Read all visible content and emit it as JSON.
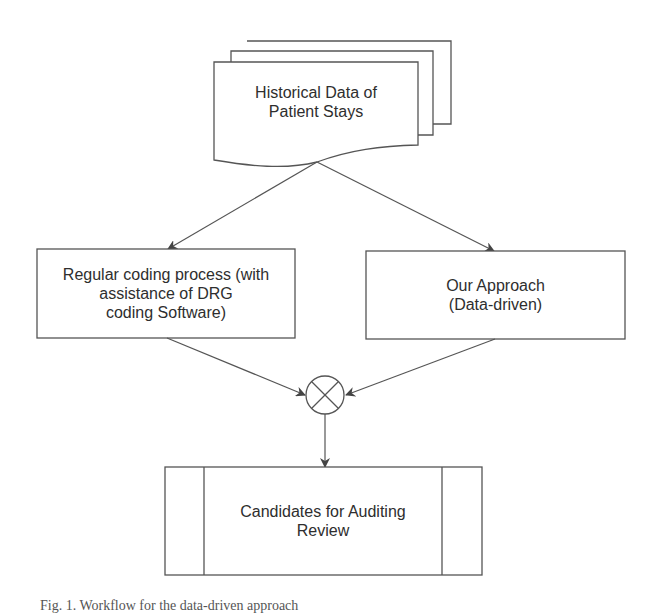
{
  "diagram": {
    "source": {
      "shape": "multi-document",
      "label": "Historical Data of Patient Stays",
      "line1": "Historical Data of",
      "line2": "Patient Stays"
    },
    "left_process": {
      "shape": "rectangle",
      "label": "Regular coding process (with assistance of DRG coding Software)",
      "line1": "Regular coding process (with",
      "line2": "assistance of DRG",
      "line3": "coding Software)"
    },
    "right_process": {
      "shape": "rectangle",
      "label": "Our Approach (Data-driven)",
      "line1": "Our Approach",
      "line2": "(Data-driven)"
    },
    "merge": {
      "shape": "summing-junction",
      "symbol": "⊗"
    },
    "output": {
      "shape": "predefined-process",
      "label": "Candidates for Auditing Review",
      "line1": "Candidates for Auditing",
      "line2": "Review"
    },
    "edges": [
      {
        "from": "source",
        "to": "left_process"
      },
      {
        "from": "source",
        "to": "right_process"
      },
      {
        "from": "left_process",
        "to": "merge"
      },
      {
        "from": "right_process",
        "to": "merge"
      },
      {
        "from": "merge",
        "to": "output"
      }
    ],
    "caption": "Fig. 1. Workflow for the data-driven approach"
  },
  "colors": {
    "stroke": "#555555",
    "text": "#2e2e2e",
    "background": "#ffffff"
  }
}
